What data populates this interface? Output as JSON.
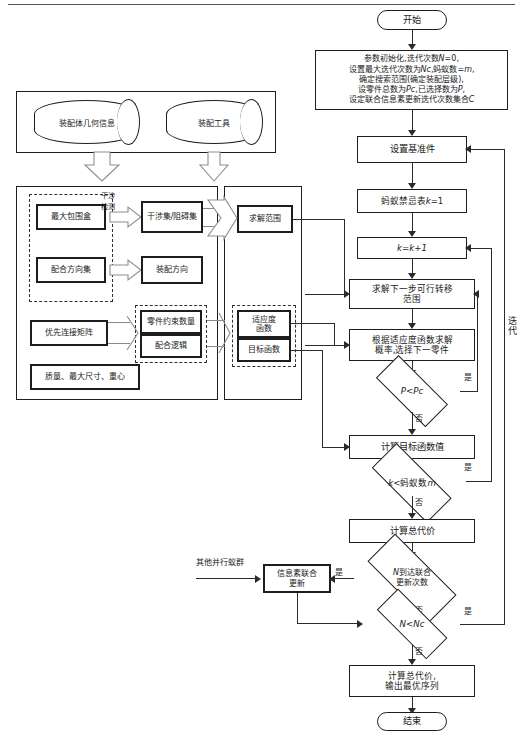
{
  "diagram": {
    "title_caption": "",
    "side_label_iteration": "迭代",
    "external_input_label": "其他并行蚁群"
  },
  "inputs": {
    "sources": [
      {
        "id": "geom",
        "label": "装配体几何信息"
      },
      {
        "id": "tools",
        "label": "装配工具"
      }
    ]
  },
  "left_panel": {
    "group_interference": {
      "connector_label": "干涉检测",
      "items": [
        {
          "id": "bbox",
          "label": "最大包围盒"
        },
        {
          "id": "matedir",
          "label": "配合方向集"
        }
      ]
    },
    "results": [
      {
        "id": "interset",
        "label": "干涉集/阻碍集"
      },
      {
        "id": "asmdir",
        "label": "装配方向"
      }
    ],
    "matrix": {
      "id": "priority",
      "label": "优先连接矩阵"
    },
    "constraint_group": [
      {
        "id": "partcons",
        "label": "零件约束数量"
      },
      {
        "id": "matelogic",
        "label": "配合逻辑"
      }
    ],
    "properties": {
      "id": "props",
      "label": "质量、最大尺寸、重心"
    }
  },
  "mid_panel": {
    "solution_range": {
      "id": "range",
      "label": "求解范围"
    },
    "function_group": [
      {
        "id": "fitness",
        "label": "适应度\n函数"
      },
      {
        "id": "objective",
        "label": "目标函数"
      }
    ]
  },
  "flow": {
    "start": "开始",
    "init": "参数初始化,迭代次数N=0,\n设置最大迭代次数为Nc,蚂蚁数=m,\n确定搜索范围(确定装配层级),\n设零件总数为Pc,已选择数为P,\n设定联合信息素更新迭代次数集合C",
    "set_datum": "设置基准件",
    "taboo": "蚂蚁禁忌表k=1",
    "k_inc": "k=k+1",
    "next_range": "求解下一步可行转移\n范围",
    "select_part": "根据适应度函数求解\n概率,选择下一零件",
    "dec_p": "P<Pc",
    "calc_obj": "计算目标函数值",
    "dec_k": "k<蚂蚁数m",
    "total_cost": "计算总代价",
    "dec_joint": "N到达联合\n更新次数",
    "joint_update": "信息素联合\n更新",
    "dec_n": "N<Nc",
    "final": "计算总代价,\n输出最优序列",
    "end": "结束"
  },
  "labels": {
    "yes": "是",
    "no": "否"
  }
}
